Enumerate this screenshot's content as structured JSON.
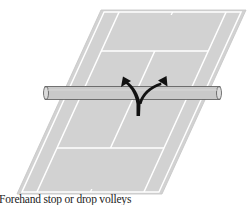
{
  "diagram": {
    "court_color": "#d2d2d2",
    "court_border_color": "#c4c4c4",
    "line_color": "#ffffff",
    "net_color": "#c9c9c9",
    "net_outline_color": "#555555",
    "arrow_color": "#111111",
    "arrow_description": "Y-shaped arrow rising from near court toward the net, splitting left and right"
  },
  "caption": "Forehand stop or drop volleys"
}
